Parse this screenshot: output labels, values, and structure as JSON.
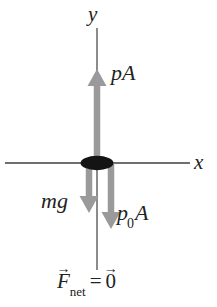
{
  "figure": {
    "type": "physics-free-body-diagram",
    "canvas": {
      "width": 217,
      "height": 307,
      "background": "#ffffff"
    },
    "colors": {
      "axis": "#6f6f6f",
      "arrow": "#9a9a9a",
      "object": "#141414",
      "text": "#222222"
    },
    "axes": {
      "x": {
        "label": "x",
        "line": {
          "x1": 5,
          "y1": 163,
          "x2": 190,
          "y2": 163
        },
        "label_pos": {
          "x": 194,
          "y": 152
        }
      },
      "y": {
        "label": "y",
        "line": {
          "x1": 97,
          "y1": 28,
          "x2": 97,
          "y2": 270
        },
        "label_pos": {
          "x": 88,
          "y": 4
        }
      }
    },
    "object": {
      "name": "piston-ellipse",
      "cx": 97,
      "cy": 163,
      "rx": 16,
      "ry": 7,
      "fill": "#141414"
    },
    "forces": [
      {
        "id": "pA",
        "label": "pA",
        "label_plain": "pA",
        "direction": "up",
        "shaft_x": 97,
        "tail_y": 163,
        "tip_y": 70,
        "label_pos": {
          "x": 111,
          "y": 62
        }
      },
      {
        "id": "mg",
        "label": "mg",
        "label_plain": "mg",
        "direction": "down",
        "shaft_x": 89,
        "tail_y": 163,
        "tip_y": 212,
        "label_pos": {
          "x": 41,
          "y": 190
        }
      },
      {
        "id": "p0A",
        "label_base": "p",
        "label_sub": "0",
        "label_tail": "A",
        "label_plain": "p0A",
        "direction": "down",
        "shaft_x": 111,
        "tail_y": 163,
        "tip_y": 228,
        "label_pos": {
          "x": 117,
          "y": 202
        }
      }
    ],
    "equation": {
      "lhs_symbol": "F",
      "lhs_subscript": "net",
      "relation": "=",
      "rhs_symbol": "0",
      "vector_accent": "→",
      "plain": "F_net = 0",
      "pos": {
        "x": 57,
        "y": 271
      }
    }
  }
}
